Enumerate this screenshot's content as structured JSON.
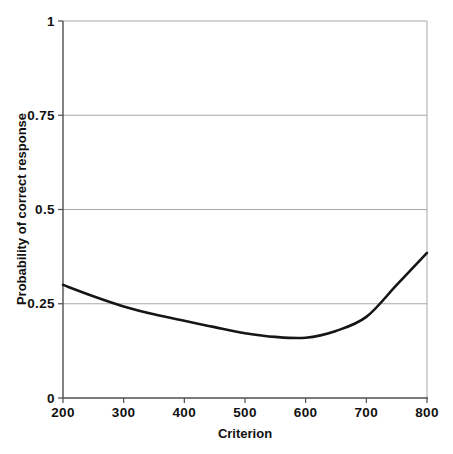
{
  "chart_data": {
    "type": "line",
    "title": "",
    "xlabel": "Criterion",
    "ylabel": "Probability of correct response",
    "xlim": [
      200,
      800
    ],
    "ylim": [
      0,
      1
    ],
    "x_ticks": [
      200,
      300,
      400,
      500,
      600,
      700,
      800
    ],
    "x_tick_labels": [
      "200",
      "300",
      "400",
      "500",
      "600",
      "700",
      "800"
    ],
    "y_ticks": [
      0,
      0.25,
      0.5,
      0.75,
      1
    ],
    "y_tick_labels": [
      "0",
      "0.25",
      "0.5",
      "0.75",
      "1"
    ],
    "grid": "horizontal-only",
    "legend": "none",
    "plot_border_right": true,
    "series": [
      {
        "name": "probability-of-correct-response",
        "x": [
          200,
          250,
          300,
          350,
          400,
          450,
          500,
          550,
          600,
          650,
          700,
          750,
          800
        ],
        "y": [
          0.3,
          0.27,
          0.243,
          0.222,
          0.205,
          0.188,
          0.172,
          0.162,
          0.16,
          0.178,
          0.215,
          0.3,
          0.385
        ]
      }
    ],
    "colors": {
      "curve": "#161616",
      "axis": "#4f4f4f",
      "grid": "#a9a9a9",
      "text": "#111111",
      "background": "#ffffff"
    }
  }
}
